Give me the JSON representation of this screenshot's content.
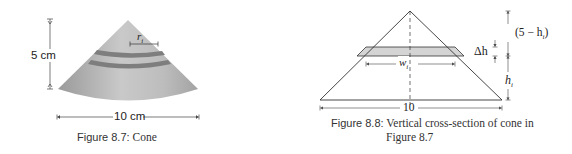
{
  "figure_8_7": {
    "title": "Cone",
    "caption_label": "Figure 8.7:",
    "caption_text": "Cone",
    "height_label": "5 cm",
    "width_label": "10 cm",
    "radius_label": "r",
    "radius_subscript": "i",
    "colors": {
      "cone_light": "#c8c8c8",
      "cone_dark": "#8a8a8a",
      "band": "#7a7a7a"
    }
  },
  "figure_8_8": {
    "caption_label": "Figure 8.8:",
    "caption_line1": "Vertical cross-section of cone in",
    "caption_line2": "Figure 8.7",
    "base_label": "10",
    "width_label": "w",
    "width_subscript": "i",
    "delta_h_label": "Δh",
    "top_segment_label": "(5 − h",
    "top_segment_subscript": "i",
    "top_segment_close": ")",
    "height_label": "h",
    "height_subscript": "i",
    "colors": {
      "strip_fill": "#d4d4d4",
      "lines": "#333333"
    }
  }
}
